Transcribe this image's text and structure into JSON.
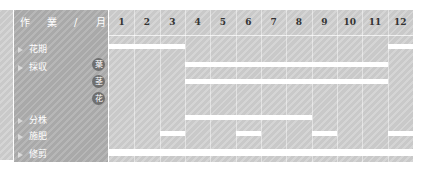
{
  "header": {
    "label_chars": [
      "作",
      "業",
      "/",
      "月"
    ]
  },
  "months": [
    "1",
    "2",
    "3",
    "4",
    "5",
    "6",
    "7",
    "8",
    "9",
    "10",
    "11",
    "12"
  ],
  "rows": [
    {
      "label": "花期",
      "badge": "",
      "y": 33
    },
    {
      "label": "採収",
      "badge": "葉",
      "y": 51
    },
    {
      "label": "",
      "badge": "茎",
      "y": 68
    },
    {
      "label": "",
      "badge": "花",
      "y": 85
    },
    {
      "label": "分株",
      "badge": "",
      "y": 104
    },
    {
      "label": "施肥",
      "badge": "",
      "y": 120
    },
    {
      "label": "修剪",
      "badge": "",
      "y": 138
    }
  ],
  "chart_data": {
    "type": "table",
    "xlabel": "月",
    "categories": [
      "1",
      "2",
      "3",
      "4",
      "5",
      "6",
      "7",
      "8",
      "9",
      "10",
      "11",
      "12"
    ],
    "series": [
      {
        "name": "花期",
        "months": [
          1,
          2,
          3,
          12
        ]
      },
      {
        "name": "採収 葉",
        "months": [
          4,
          5,
          6,
          7,
          8,
          9,
          10,
          11
        ]
      },
      {
        "name": "採収 茎",
        "months": [
          4,
          5,
          6,
          7,
          8,
          9,
          10,
          11
        ]
      },
      {
        "name": "採収 花",
        "months": []
      },
      {
        "name": "分株",
        "months": [
          4,
          5,
          6,
          7,
          8
        ]
      },
      {
        "name": "施肥",
        "months": [
          3,
          6,
          9,
          12
        ]
      },
      {
        "name": "修剪",
        "months": [
          1,
          2,
          3,
          4,
          5,
          6,
          7,
          8,
          9,
          10,
          11,
          12
        ]
      }
    ],
    "bar_color": "#ffffff",
    "background_color": "#c9c9c9"
  }
}
